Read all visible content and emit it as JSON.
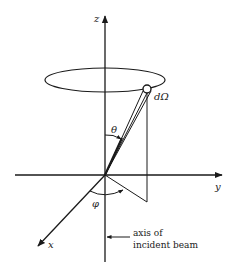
{
  "diagram": {
    "axes": {
      "z_label": "z",
      "y_label": "y",
      "x_label": "x"
    },
    "angles": {
      "polar_label": "θ",
      "azimuthal_label": "φ"
    },
    "solid_angle_label": "dΩ",
    "annotation": {
      "line1": "axis of",
      "line2": "incident beam"
    },
    "colors": {
      "stroke": "#1a1a1a",
      "background": "#ffffff"
    }
  }
}
